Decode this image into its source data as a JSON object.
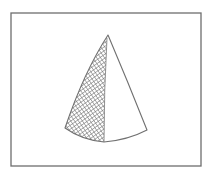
{
  "figure": {
    "frame": {
      "x": 11,
      "y": 13,
      "width": 190,
      "height": 153,
      "stroke": "#6e6e6e",
      "stroke_width": 1.3
    },
    "shape": {
      "stroke": "#707070",
      "fill": "#ffffff",
      "apex": [
        108,
        35
      ],
      "left_base": [
        65,
        128
      ],
      "bottom_mid": [
        104,
        142
      ],
      "right_base": [
        147,
        130
      ],
      "outline_path": "M108,35 Q84,72 65,128 Q82,140 104,142 Q128,140 147,130 Q128,82 108,35 Z",
      "hatch_region_path": "M108,36 Q84,72 65,128 Q82,140 104,142 Q104,90 107,38 Z",
      "hatch": {
        "color": "#7a7a7a",
        "spacing": 3.2,
        "angles_deg": [
          55,
          -35
        ],
        "stroke_width": 0.7
      }
    }
  }
}
